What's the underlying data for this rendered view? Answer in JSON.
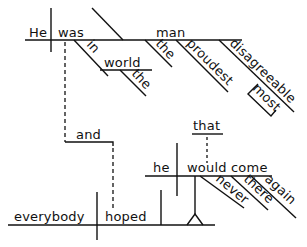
{
  "diagram": {
    "type": "Reed-Kellogg sentence diagram",
    "sentence_parts": {
      "main_clause": {
        "subject": "He",
        "verb": "was",
        "complement": "man",
        "complement_modifiers": [
          "the",
          "proudest",
          "disagreeable"
        ],
        "adverb_of_adjective": "most",
        "prepositional_phrase": {
          "preposition": "in",
          "object": "world",
          "article": "the"
        }
      },
      "conjunction": "and",
      "second_clause": {
        "subject": "everybody",
        "verb": "hoped"
      },
      "noun_clause": {
        "connector": "that",
        "subject": "he",
        "verb": "would come",
        "modifiers": [
          "never",
          "there",
          "again"
        ]
      }
    },
    "labels": {
      "he_main": "He",
      "was": "was",
      "man": "man",
      "in": "in",
      "world": "world",
      "the_world": "the",
      "the_man": "the",
      "proudest": "proudest",
      "disagreeable": "disagreeable",
      "most": "most",
      "and": "and",
      "everybody": "everybody",
      "hoped": "hoped",
      "that": "that",
      "he_clause": "he",
      "would_come": "would come",
      "never": "never",
      "there": "there",
      "again": "again"
    },
    "colors": {
      "ink": "#111111",
      "background": "#ffffff"
    }
  }
}
